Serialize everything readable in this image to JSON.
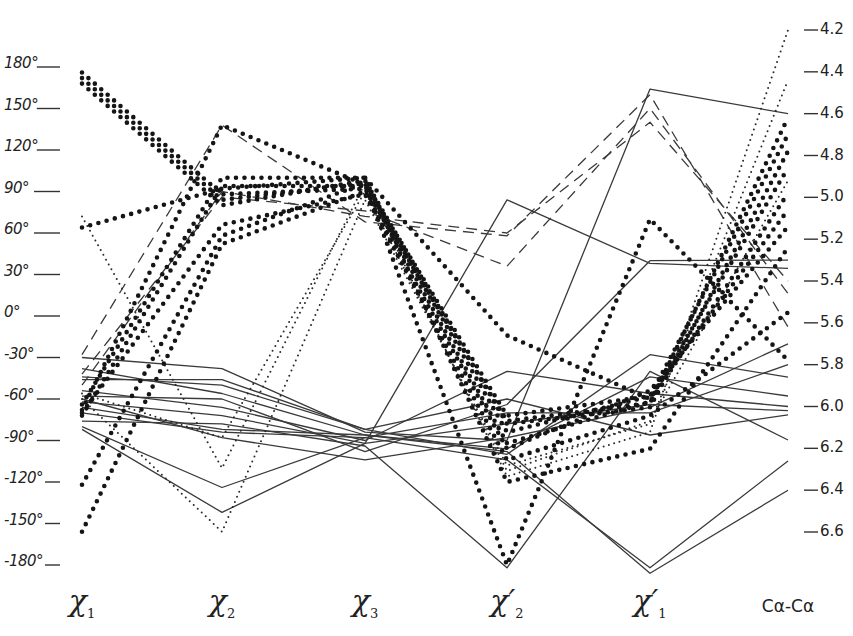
{
  "chart_data": {
    "type": "line",
    "subtype": "parallel-coordinates",
    "title": "",
    "categories": [
      "χ1",
      "χ2",
      "χ3",
      "χ2′",
      "χ1′",
      "Cα-Cα"
    ],
    "category_labels": [
      {
        "main": "χ",
        "sub": "1",
        "prime": ""
      },
      {
        "main": "χ",
        "sub": "2",
        "prime": ""
      },
      {
        "main": "χ",
        "sub": "3",
        "prime": ""
      },
      {
        "main": "χ",
        "sub": "2",
        "prime": "′"
      },
      {
        "main": "χ",
        "sub": "1",
        "prime": "′"
      },
      {
        "main": "Cα-Cα",
        "sub": "",
        "prime": ""
      }
    ],
    "left_axis": {
      "label": "dihedral angle (degrees)",
      "ylim": [
        -180,
        180
      ],
      "ticks": [
        "180°",
        "150°",
        "120°",
        "90°",
        "60°",
        "30°",
        "0°",
        "-30°",
        "-60°",
        "-90°",
        "-120°",
        "-150°",
        "-180°"
      ],
      "tick_values": [
        180,
        150,
        120,
        90,
        60,
        30,
        0,
        -30,
        -60,
        -90,
        -120,
        -150,
        -180
      ]
    },
    "right_axis": {
      "label": "Cα-Cα distance (Å)",
      "ylim": [
        4.2,
        6.6
      ],
      "inverted": true,
      "ticks": [
        "4.2",
        "4.4",
        "4.6",
        "4.8",
        "5.0",
        "5.2",
        "5.4",
        "5.6",
        "5.8",
        "6.0",
        "6.2",
        "6.4",
        "6.6"
      ],
      "tick_values": [
        4.2,
        4.4,
        4.6,
        4.8,
        5.0,
        5.2,
        5.4,
        5.6,
        5.8,
        6.0,
        6.2,
        6.4,
        6.6
      ]
    },
    "grid": false,
    "legend": null,
    "line_styles": {
      "solid": "thin solid line",
      "dashed": "dashed line",
      "dotted_small": "fine dotted line",
      "dotted_bold": "heavy dotted line"
    },
    "series": [
      {
        "style": "dotted_bold",
        "values": [
          176,
          88,
          92,
          -76,
          -63,
          4.62
        ]
      },
      {
        "style": "dotted_bold",
        "values": [
          172,
          84,
          96,
          -72,
          -58,
          4.7
        ]
      },
      {
        "style": "dotted_bold",
        "values": [
          168,
          80,
          98,
          -78,
          -66,
          4.78
        ]
      },
      {
        "style": "dotted_bold",
        "values": [
          64,
          92,
          100,
          -14,
          -60,
          4.86
        ]
      },
      {
        "style": "dotted_bold",
        "values": [
          -68,
          138,
          95,
          -180,
          70,
          5.78
        ]
      },
      {
        "style": "dotted_bold",
        "values": [
          -64,
          100,
          100,
          -120,
          -96,
          5.24
        ]
      },
      {
        "style": "dotted_bold",
        "values": [
          -72,
          94,
          94,
          -92,
          -62,
          4.98
        ]
      },
      {
        "style": "dotted_bold",
        "values": [
          -122,
          58,
          96,
          -84,
          -58,
          5.06
        ]
      },
      {
        "style": "dotted_bold",
        "values": [
          -156,
          52,
          90,
          -96,
          -54,
          5.14
        ]
      },
      {
        "style": "dotted_bold",
        "values": [
          -70,
          66,
          88,
          -104,
          -72,
          5.55
        ]
      },
      {
        "style": "dotted_small",
        "values": [
          72,
          -110,
          96,
          -116,
          -84,
          4.2
        ]
      },
      {
        "style": "dotted_small",
        "values": [
          -60,
          -156,
          84,
          -108,
          -78,
          4.44
        ]
      },
      {
        "style": "dotted_small",
        "values": [
          -56,
          -88,
          90,
          -112,
          -76,
          4.92
        ]
      },
      {
        "style": "dashed",
        "values": [
          -28,
          138,
          68,
          58,
          160,
          5.62
        ]
      },
      {
        "style": "dashed",
        "values": [
          -42,
          86,
          76,
          36,
          150,
          5.46
        ]
      },
      {
        "style": "dashed",
        "values": [
          -50,
          90,
          72,
          60,
          140,
          5.4
        ]
      },
      {
        "style": "solid",
        "values": [
          -30,
          -38,
          -84,
          -90,
          164,
          4.6
        ]
      },
      {
        "style": "solid",
        "values": [
          -46,
          -46,
          -82,
          -100,
          -28,
          5.86
        ]
      },
      {
        "style": "solid",
        "values": [
          -38,
          -56,
          -86,
          -96,
          -44,
          5.95
        ]
      },
      {
        "style": "solid",
        "values": [
          -54,
          -66,
          -90,
          -40,
          -56,
          6.0
        ]
      },
      {
        "style": "solid",
        "values": [
          -62,
          -72,
          -92,
          -78,
          -64,
          6.02
        ]
      },
      {
        "style": "solid",
        "values": [
          -66,
          -82,
          -86,
          -98,
          -186,
          6.4
        ]
      },
      {
        "style": "solid",
        "values": [
          -70,
          -84,
          -88,
          -104,
          -182,
          6.26
        ]
      },
      {
        "style": "solid",
        "values": [
          -76,
          -78,
          -94,
          -182,
          -40,
          6.16
        ]
      },
      {
        "style": "solid",
        "values": [
          -80,
          -124,
          -88,
          -70,
          -70,
          5.8
        ]
      },
      {
        "style": "solid",
        "values": [
          -82,
          -142,
          -92,
          84,
          38,
          5.34
        ]
      },
      {
        "style": "solid",
        "values": [
          -58,
          -60,
          -98,
          -64,
          40,
          5.3
        ]
      },
      {
        "style": "solid",
        "values": [
          -44,
          -50,
          -82,
          -60,
          -86,
          6.04
        ]
      },
      {
        "style": "solid",
        "values": [
          -60,
          -88,
          -104,
          -88,
          -66,
          5.7
        ]
      }
    ]
  }
}
